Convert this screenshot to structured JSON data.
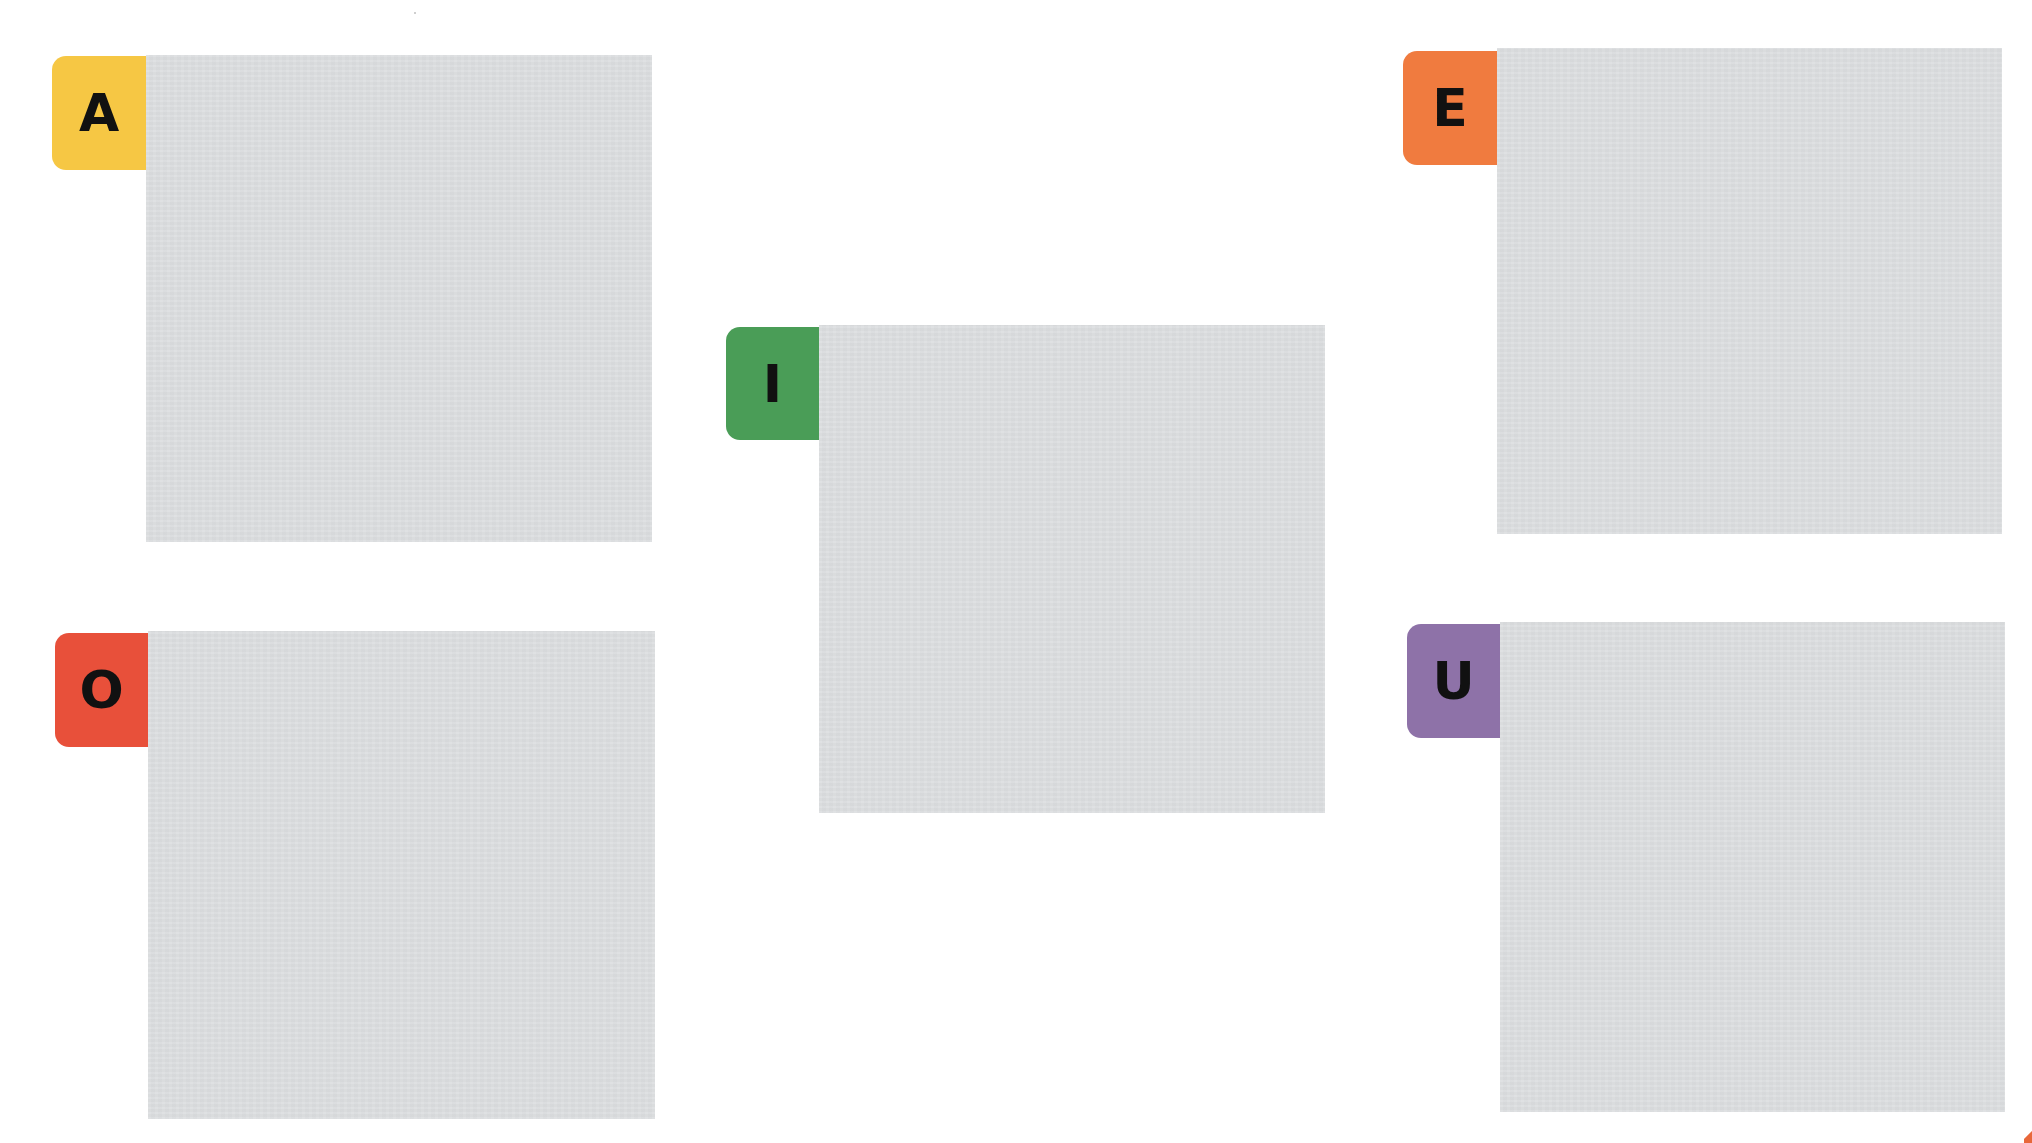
{
  "colors": {
    "background": "#ffffff",
    "panel": "#dcdee0",
    "letter": "#111111"
  },
  "cards": [
    {
      "id": "A",
      "letter": "A",
      "tab_color": "#f6c744",
      "tab": {
        "left": 52,
        "top": 56,
        "width": 94,
        "height": 114
      },
      "panel": {
        "left": 146,
        "top": 55,
        "width": 506,
        "height": 487
      }
    },
    {
      "id": "I",
      "letter": "I",
      "tab_color": "#4a9d57",
      "tab": {
        "left": 726,
        "top": 327,
        "width": 93,
        "height": 113
      },
      "panel": {
        "left": 819,
        "top": 325,
        "width": 506,
        "height": 488
      }
    },
    {
      "id": "E",
      "letter": "E",
      "tab_color": "#f07b3f",
      "tab": {
        "left": 1403,
        "top": 51,
        "width": 94,
        "height": 114
      },
      "panel": {
        "left": 1497,
        "top": 48,
        "width": 505,
        "height": 486
      }
    },
    {
      "id": "O",
      "letter": "O",
      "tab_color": "#e8503a",
      "tab": {
        "left": 55,
        "top": 633,
        "width": 93,
        "height": 114
      },
      "panel": {
        "left": 148,
        "top": 631,
        "width": 507,
        "height": 488
      }
    },
    {
      "id": "U",
      "letter": "U",
      "tab_color": "#8e72a8",
      "tab": {
        "left": 1407,
        "top": 624,
        "width": 93,
        "height": 114
      },
      "panel": {
        "left": 1500,
        "top": 622,
        "width": 505,
        "height": 490
      }
    }
  ]
}
